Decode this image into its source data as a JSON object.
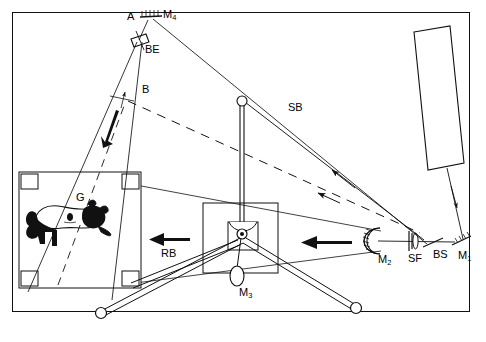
{
  "figure": {
    "domain": "optical-diagram",
    "title_visible": false,
    "background": "#ffffff",
    "line_color": "#111111",
    "frame": {
      "x": 12,
      "y": 12,
      "width": 458,
      "height": 300,
      "border_px": 1.6
    }
  },
  "labels": [
    {
      "id": "A",
      "text": "A",
      "sub": "",
      "x": 127,
      "y": 11,
      "name": "label-aperture-a"
    },
    {
      "id": "M4",
      "text": "M",
      "sub": "4",
      "x": 163,
      "y": 9,
      "name": "label-mirror-m4"
    },
    {
      "id": "BE",
      "text": "BE",
      "sub": "",
      "x": 145,
      "y": 44,
      "name": "label-beam-expander"
    },
    {
      "id": "B",
      "text": "B",
      "sub": "",
      "x": 142,
      "y": 84,
      "name": "label-point-b"
    },
    {
      "id": "SB",
      "text": "SB",
      "sub": "",
      "x": 288,
      "y": 102,
      "name": "label-signal-beam"
    },
    {
      "id": "G",
      "text": "G",
      "sub": "",
      "x": 76,
      "y": 192,
      "name": "label-hologram-plate-g"
    },
    {
      "id": "RB",
      "text": "RB",
      "sub": "",
      "x": 161,
      "y": 248,
      "name": "label-reference-beam"
    },
    {
      "id": "M2",
      "text": "M",
      "sub": "2",
      "x": 378,
      "y": 254,
      "name": "label-mirror-m2"
    },
    {
      "id": "SF",
      "text": "SF",
      "sub": "",
      "x": 408,
      "y": 253,
      "name": "label-spatial-filter"
    },
    {
      "id": "BS",
      "text": "BS",
      "sub": "",
      "x": 433,
      "y": 249,
      "name": "label-beam-splitter"
    },
    {
      "id": "M1",
      "text": "M",
      "sub": "1",
      "x": 458,
      "y": 250,
      "name": "label-mirror-m1"
    },
    {
      "id": "M3",
      "text": "M",
      "sub": "3",
      "x": 239,
      "y": 287,
      "name": "label-mirror-m3"
    }
  ],
  "components": {
    "laser": {
      "name": "laser-source",
      "described_as": "tilted rectangle, top right, unlabeled"
    },
    "mirror_m1": {
      "name": "mirror-m1",
      "described_as": "hatched flat mirror, bottom right"
    },
    "beam_splitter": {
      "name": "beam-splitter-bs",
      "described_as": "thin tilted plate"
    },
    "spatial_filter": {
      "name": "spatial-filter-sf",
      "described_as": "vertical slit with lens"
    },
    "mirror_m2": {
      "name": "mirror-m2",
      "described_as": "concave hatched mirror facing left"
    },
    "mirror_m3": {
      "name": "mirror-m3",
      "described_as": "small mirror on gimbal mount at tripod head"
    },
    "mirror_m4": {
      "name": "mirror-m4",
      "described_as": "hatched flat mirror at top, near aperture A"
    },
    "beam_expander": {
      "name": "beam-expander-be",
      "described_as": "small tilted rectangular element on beam"
    },
    "hologram_plate": {
      "name": "hologram-plate-g",
      "described_as": "square plate with four corner clips containing cow image"
    },
    "tripod": {
      "name": "tripod-mount",
      "described_as": "three-legged stand with ball feet supporting M3"
    }
  },
  "beams": {
    "reference_beam_arrow": {
      "name": "reference-beam-arrow",
      "direction": "left",
      "label": "RB"
    },
    "expanding_beam_arrow": {
      "name": "expanding-beam-arrow",
      "direction": "left",
      "label": ""
    },
    "signal_beam_arrow": {
      "name": "signal-beam-arrow",
      "direction": "down-right-to-up-left",
      "label": "SB"
    },
    "dashed_beam": {
      "name": "dashed-beam-path",
      "style": "dashed"
    },
    "point_b_arrow": {
      "name": "point-b-arrow",
      "direction": "down-left"
    }
  }
}
